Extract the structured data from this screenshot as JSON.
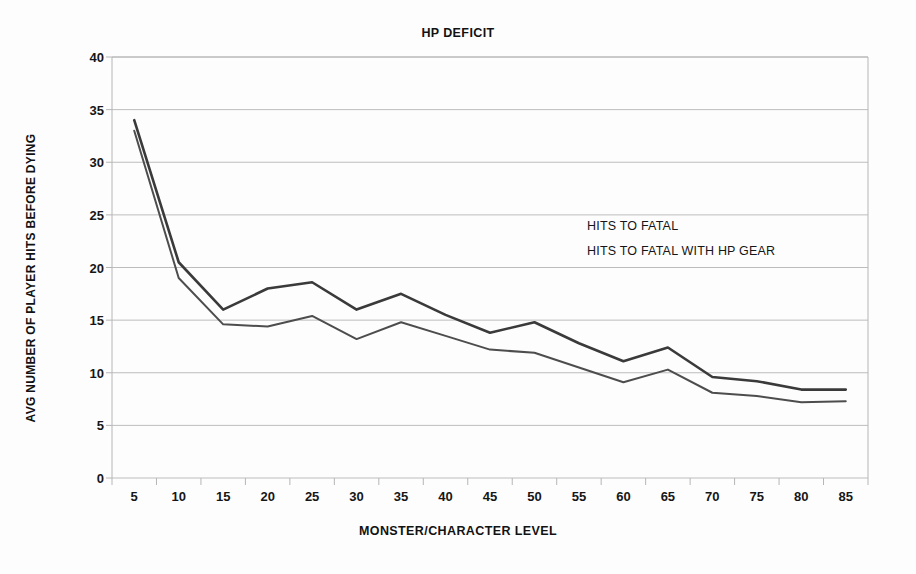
{
  "chart_data": {
    "type": "line",
    "title": "HP DEFICIT",
    "xlabel": "MONSTER/CHARACTER LEVEL",
    "ylabel": "AVG NUMBER OF PLAYER HITS BEFORE DYING",
    "categories": [
      5,
      10,
      15,
      20,
      25,
      30,
      35,
      40,
      45,
      50,
      55,
      60,
      65,
      70,
      75,
      80,
      85
    ],
    "xtick_labels": [
      "5",
      "10",
      "15",
      "20",
      "25",
      "30",
      "35",
      "40",
      "45",
      "50",
      "55",
      "60",
      "65",
      "70",
      "75",
      "80",
      "85"
    ],
    "ytick_labels": [
      "0",
      "5",
      "10",
      "15",
      "20",
      "25",
      "30",
      "35",
      "40"
    ],
    "yticks": [
      0,
      5,
      10,
      15,
      20,
      25,
      30,
      35,
      40
    ],
    "ylim": [
      0,
      40
    ],
    "grid": true,
    "grid_axis": "y",
    "legend_position": "inside-upper-right",
    "series": [
      {
        "name": "HITS TO FATAL",
        "color": "#4d4d4d",
        "width": 2.0,
        "values": [
          33.0,
          19.0,
          14.6,
          14.4,
          15.4,
          13.2,
          14.8,
          13.5,
          12.2,
          11.9,
          10.5,
          9.1,
          10.3,
          8.1,
          7.8,
          7.2,
          7.3
        ]
      },
      {
        "name": "HITS TO FATAL WITH HP GEAR",
        "color": "#3a3a3a",
        "width": 2.6,
        "values": [
          34.0,
          20.5,
          16.0,
          18.0,
          18.6,
          16.0,
          17.5,
          15.5,
          13.8,
          14.8,
          12.8,
          11.1,
          12.4,
          9.6,
          9.2,
          8.4,
          8.4
        ]
      }
    ]
  },
  "colors": {
    "plot_border": "#b6b6b6",
    "gridline": "#bdbdbd",
    "axis_text": "#161616",
    "background": "#fdfdfd"
  },
  "geometry": {
    "plot_left": 112,
    "plot_right": 868,
    "plot_top": 57,
    "plot_bottom": 478
  }
}
